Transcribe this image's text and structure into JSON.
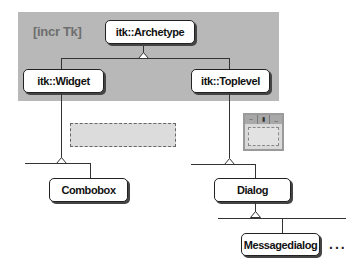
{
  "diagram": {
    "region_label": "[incr Tk]",
    "nodes": {
      "archetype": "itk::Archetype",
      "widget": "itk::Widget",
      "toplevel": "itk::Toplevel",
      "combobox": "Combobox",
      "dialog": "Dialog",
      "messagedialog": "Messagedialog"
    },
    "ellipsis": "...",
    "mini_window_buttons": [
      "–",
      "▮",
      "_"
    ],
    "edges": [
      {
        "from": "itk::Widget",
        "to": "itk::Archetype",
        "type": "inheritance"
      },
      {
        "from": "itk::Toplevel",
        "to": "itk::Archetype",
        "type": "inheritance"
      },
      {
        "from": "Combobox",
        "to": "itk::Widget",
        "type": "inheritance"
      },
      {
        "from": "Dialog",
        "to": "itk::Toplevel",
        "type": "inheritance"
      },
      {
        "from": "Messagedialog",
        "to": "Dialog",
        "type": "inheritance"
      }
    ],
    "colors": {
      "region": "#b8b8b8",
      "region_label": "#6e6e6e",
      "node_border": "#222222",
      "line": "#333333"
    }
  }
}
